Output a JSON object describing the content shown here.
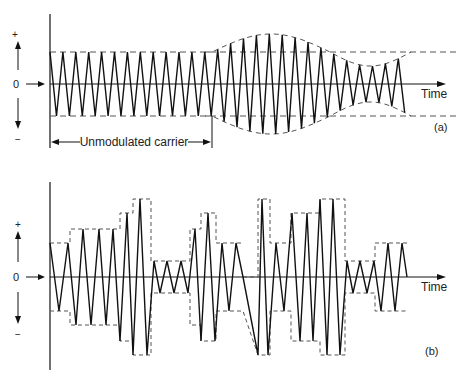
{
  "figure": {
    "panel_a": {
      "tag": "(a)",
      "time_label": "Time",
      "zero_label": "0",
      "plus_label": "+",
      "minus_label": "−",
      "carrier_label": "Unmodulated carrier",
      "description": "Amplitude-modulated carrier: constant amplitude section followed by swelling then shrinking envelope"
    },
    "panel_b": {
      "tag": "(b)",
      "time_label": "Time",
      "zero_label": "0",
      "plus_label": "+",
      "minus_label": "−",
      "description": "Carrier with stepped (quantized) amplitude envelope"
    },
    "colors": {
      "line": "#111111",
      "dash": "#555555",
      "background": "#ffffff"
    }
  }
}
